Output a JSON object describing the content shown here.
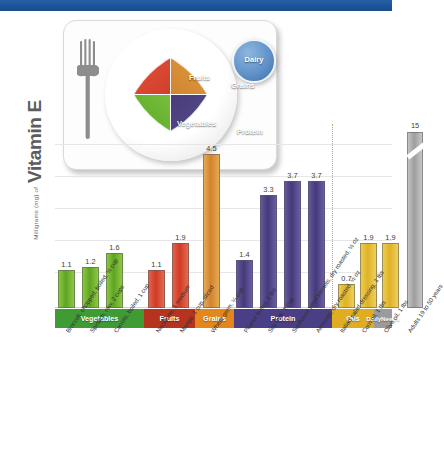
{
  "header": {
    "band_color": "#1d5398"
  },
  "plate": {
    "title": "MyPlate",
    "fork_icon": "fork-icon",
    "segments": [
      {
        "name": "Fruits",
        "label": "Fruits",
        "color": "#d23b27"
      },
      {
        "name": "Grains",
        "label": "Grains",
        "color": "#d0822c"
      },
      {
        "name": "Vegetables",
        "label": "Vegetables",
        "color": "#7dc23f"
      },
      {
        "name": "Protein",
        "label": "Protein",
        "color": "#463a77"
      }
    ],
    "dairy": {
      "label": "Dairy",
      "color": "#6093c9"
    }
  },
  "axis": {
    "y_unit_text": "Milligrams (mg) of",
    "y_title": "Vitamin E"
  },
  "categories": [
    {
      "label": "Vegetables",
      "color": "#3f9c35",
      "left": 0,
      "width": 89
    },
    {
      "label": "Fruits",
      "color": "#b5331f",
      "left": 89,
      "width": 51
    },
    {
      "label": "Grains",
      "color": "#e3861b",
      "left": 140,
      "width": 39
    },
    {
      "label": "Protein",
      "color": "#4a3f86",
      "left": 179,
      "width": 98
    },
    {
      "label": "Oils",
      "color": "#e0ad21",
      "left": 277,
      "width": 42
    },
    {
      "label": "Daily\nNeeds",
      "color": "#9b9b9b",
      "left": 319,
      "width": 18
    }
  ],
  "chart_data": {
    "type": "bar",
    "title": "Vitamin E",
    "xlabel": "",
    "ylabel": "Milligrams (mg) of Vitamin E",
    "ylim": [
      0,
      5.2
    ],
    "grid": true,
    "legend": "none",
    "note": "Daily Needs bar is axis-broken; its true value is 15 mg",
    "categories": [
      "Broccoli, chopped, boiled, 1/2 cup",
      "Spinach, raw, 2 cups",
      "Carrots, boiled, 1 cup",
      "Nectarine, 1 medium",
      "Mango, 1 cup, sliced",
      "Wheat germ, 1/4 cup",
      "Peanut butter, 1 tbs",
      "Soy milk, 1 cup",
      "Sunflower seed kernels, dry roasted, 1/2 oz",
      "Almonds, dry roasted, 1/2 oz",
      "Italian salad dressing, 1 tbs",
      "Corn oil, 1 tbs",
      "Olive oil, 1 tbs",
      "Adults 19 to 50 years"
    ],
    "values": [
      1.1,
      1.2,
      1.6,
      1.1,
      1.9,
      4.5,
      1.4,
      3.3,
      3.7,
      3.7,
      0.7,
      1.9,
      1.9,
      15
    ],
    "groups": [
      "Vegetables",
      "Vegetables",
      "Vegetables",
      "Fruits",
      "Fruits",
      "Grains",
      "Protein",
      "Protein",
      "Protein",
      "Protein",
      "Oils",
      "Oils",
      "Oils",
      "Daily Needs"
    ],
    "colors": [
      "#5ea524",
      "#5ea524",
      "#5ea524",
      "#d03b26",
      "#d03b26",
      "#d3842c",
      "#453a78",
      "#453a78",
      "#453a78",
      "#453a78",
      "#dfb227",
      "#dfb227",
      "#dfb227",
      "#9e9e9e"
    ]
  }
}
